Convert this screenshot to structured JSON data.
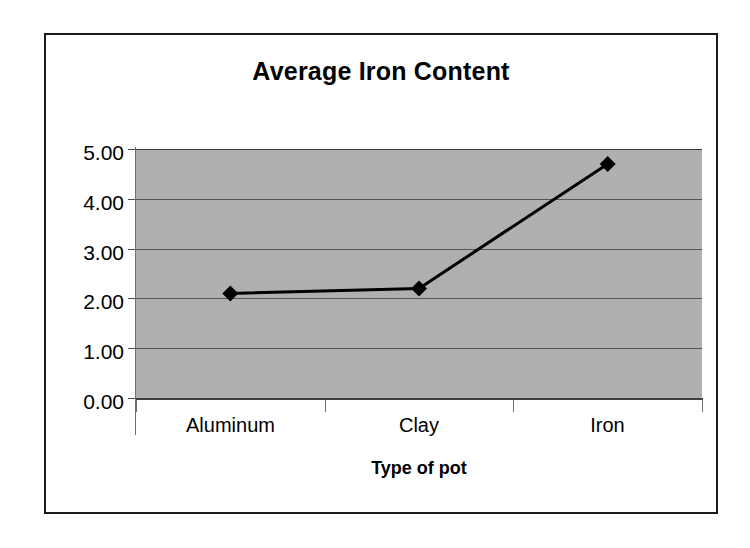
{
  "chart_data": {
    "type": "line",
    "title": "Average Iron Content",
    "xlabel": "Type of pot",
    "ylabel": "",
    "categories": [
      "Aluminum",
      "Clay",
      "Iron"
    ],
    "values": [
      2.1,
      2.2,
      4.7
    ],
    "series": [
      {
        "name": "Average Iron Content",
        "values": [
          2.1,
          2.2,
          4.7
        ],
        "marker": "diamond",
        "marker_color": "#000000",
        "line_color": "#000000"
      }
    ],
    "ylim": [
      0.0,
      5.0
    ],
    "ytick_labels": [
      "5.00",
      "4.00",
      "3.00",
      "2.00",
      "1.00",
      "0.00"
    ],
    "ytick_values": [
      5.0,
      4.0,
      3.0,
      2.0,
      1.0,
      0.0
    ],
    "ytick_step": 1.0,
    "grid": true,
    "gridline_color": "#555555",
    "legend": false,
    "legend_position": "none",
    "plot_background": "#ababab",
    "chart_background": "#ffffff",
    "border_color": "#1a1a1a",
    "text_color": "#000000"
  }
}
